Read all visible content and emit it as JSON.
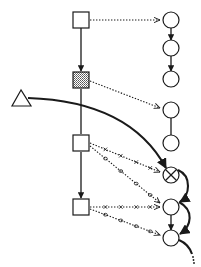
{
  "diagram": {
    "colors": {
      "stroke": "#1a1a1a",
      "shaded_fill": "#9a9a9a",
      "node_fill": "#ffffff"
    },
    "nodes": {
      "squares": [
        {
          "id": "s1",
          "style": "plain"
        },
        {
          "id": "s2",
          "style": "shaded"
        },
        {
          "id": "s3",
          "style": "plain"
        },
        {
          "id": "s4",
          "style": "plain"
        }
      ],
      "circles": [
        {
          "id": "c1",
          "style": "plain"
        },
        {
          "id": "c2",
          "style": "plain"
        },
        {
          "id": "c3",
          "style": "plain"
        },
        {
          "id": "c4",
          "style": "plain"
        },
        {
          "id": "c5",
          "style": "plain"
        },
        {
          "id": "c6",
          "style": "crossed"
        },
        {
          "id": "c7",
          "style": "plain"
        },
        {
          "id": "c8",
          "style": "plain"
        }
      ],
      "triangles": [
        {
          "id": "t1",
          "style": "plain"
        }
      ]
    },
    "edges": [
      {
        "from": "s1",
        "to": "s2",
        "style": "solid-arrow"
      },
      {
        "from": "s2",
        "to": "s3",
        "style": "solid-line"
      },
      {
        "from": "s3",
        "to": "s4",
        "style": "solid-arrow"
      },
      {
        "from": "c1",
        "to": "c2",
        "style": "solid-arrow"
      },
      {
        "from": "c2",
        "to": "c3",
        "style": "solid-arrow"
      },
      {
        "from": "c4",
        "to": "c5",
        "style": "solid-line"
      },
      {
        "from": "c5",
        "to": "c6",
        "style": "solid-arrow"
      },
      {
        "from": "c7",
        "to": "c8",
        "style": "solid-arrow"
      },
      {
        "from": "t1",
        "to": "c6",
        "style": "thick-curve-arrow"
      },
      {
        "from": "c6",
        "to": "c7",
        "style": "thick-curve-arrow"
      },
      {
        "from": "c7",
        "to": "c8",
        "style": "thick-curve-arrow"
      },
      {
        "from": "c8",
        "to": "continuation",
        "style": "thick-curve-dotted-tail"
      },
      {
        "from": "s1",
        "to": "c1",
        "style": "dotted-arrow"
      },
      {
        "from": "s2",
        "to": "c4",
        "style": "dotted-arrow"
      },
      {
        "from": "s3",
        "to": "c6",
        "style": "dotted-x-marked-arrow"
      },
      {
        "from": "s3",
        "to": "c7",
        "style": "dotted-o-marked-arrow"
      },
      {
        "from": "s4",
        "to": "c7",
        "style": "dotted-x-marked-arrow"
      },
      {
        "from": "s4",
        "to": "c8",
        "style": "dotted-o-marked-arrow"
      }
    ]
  }
}
